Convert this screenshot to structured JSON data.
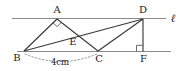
{
  "figure": {
    "background_color": "#ffffff",
    "stroke_color": "#3a3a3a",
    "thin_stroke_color": "#808080",
    "text_color": "#1a1a1a",
    "labels": {
      "A": "A",
      "B": "B",
      "C": "C",
      "D": "D",
      "E": "E",
      "F": "F",
      "line_ell": "ℓ",
      "measure_bc": "4cm"
    },
    "points": {
      "A": {
        "x": 57,
        "y": 18
      },
      "B": {
        "x": 24,
        "y": 51
      },
      "C": {
        "x": 98,
        "y": 51
      },
      "D": {
        "x": 143,
        "y": 18
      },
      "E": {
        "x": 73,
        "y": 40
      },
      "F": {
        "x": 143,
        "y": 51
      }
    },
    "lines": {
      "top_parallel": {
        "x1": 12,
        "y1": 18,
        "x2": 166,
        "y2": 18
      },
      "bottom_parallel": {
        "x1": 17,
        "y1": 51,
        "x2": 171,
        "y2": 51
      }
    },
    "segments": [
      {
        "name": "BA",
        "from": "B",
        "to": "A"
      },
      {
        "name": "AC",
        "from": "A",
        "to": "C"
      },
      {
        "name": "BD",
        "from": "B",
        "to": "D"
      },
      {
        "name": "CD",
        "from": "C",
        "to": "D"
      },
      {
        "name": "DF",
        "from": "D",
        "to": "F"
      }
    ],
    "right_angles": [
      {
        "name": "angle-at-A",
        "vertex": "A",
        "style": "diamond"
      },
      {
        "name": "angle-at-F",
        "vertex": "F",
        "style": "square"
      }
    ],
    "measure_arc": {
      "name": "bc-measure",
      "from": "B",
      "to": "C",
      "style": "dotted",
      "label": "4cm"
    }
  }
}
